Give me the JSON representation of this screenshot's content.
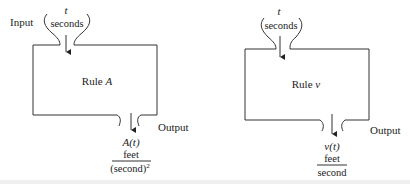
{
  "diagrams": [
    {
      "id": "rule-a",
      "input_label": "Input",
      "input_variable": "t",
      "input_unit": "seconds",
      "rule_label_prefix": "Rule ",
      "rule_label_name": "A",
      "output_label": "Output",
      "output_expression": "A(t)",
      "output_unit_numerator": "feet",
      "output_unit_denominator": "(second)",
      "output_unit_denominator_exponent": "2"
    },
    {
      "id": "rule-v",
      "input_label": "Input",
      "input_variable": "t",
      "input_unit": "seconds",
      "rule_label_prefix": "Rule ",
      "rule_label_name": "v",
      "output_label": "Output",
      "output_expression": "v(t)",
      "output_unit_numerator": "feet",
      "output_unit_denominator": "second"
    }
  ],
  "colors": {
    "line": "#333333",
    "text": "#222222",
    "background": "#ffffff"
  }
}
